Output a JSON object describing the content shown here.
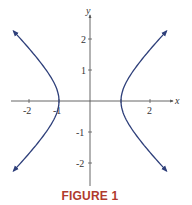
{
  "caption": {
    "text": "FIGURE 1",
    "color": "#b03a2e"
  },
  "colors": {
    "curve": "#2e3f7a",
    "axis": "#555555",
    "text": "#333333"
  },
  "chart_data": {
    "type": "line",
    "title": "",
    "caption": "FIGURE 1",
    "equation": "x^2 - y^2 = 1",
    "xlabel": "x",
    "ylabel": "y",
    "xlim": [
      -2.8,
      2.8
    ],
    "ylim": [
      -2.7,
      2.8
    ],
    "x_ticks": [
      -2,
      -1,
      1,
      2
    ],
    "x_tick_labels": [
      "-2",
      "-1",
      "",
      "2"
    ],
    "y_ticks": [
      -2,
      -1,
      1,
      2
    ],
    "y_tick_labels": [
      "-2",
      "-1",
      "1",
      "2"
    ],
    "grid": false,
    "legend": null,
    "series": [
      {
        "name": "right branch",
        "x": [
          2.47,
          2.0,
          1.5,
          1.2,
          1.0,
          1.2,
          1.5,
          2.0,
          2.47
        ],
        "y": [
          2.26,
          1.73,
          1.12,
          0.66,
          0.0,
          -0.66,
          -1.12,
          -1.73,
          -2.26
        ],
        "arrows": "both ends"
      },
      {
        "name": "left branch",
        "x": [
          -2.47,
          -2.0,
          -1.5,
          -1.2,
          -1.0,
          -1.2,
          -1.5,
          -2.0,
          -2.47
        ],
        "y": [
          2.26,
          1.73,
          1.12,
          0.66,
          0.0,
          -0.66,
          -1.12,
          -1.73,
          -2.26
        ],
        "arrows": "both ends"
      }
    ]
  }
}
